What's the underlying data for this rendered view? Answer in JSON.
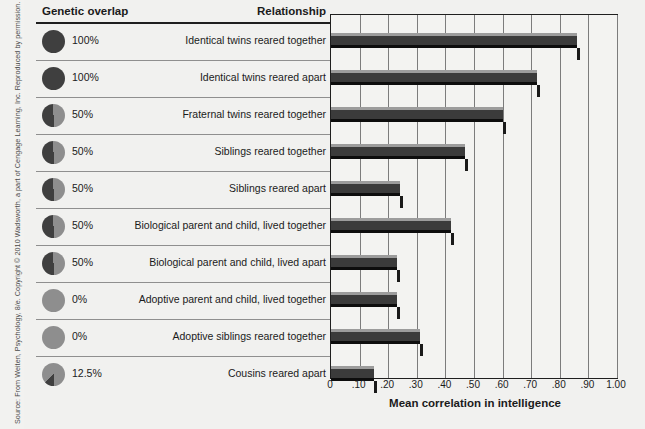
{
  "source_credit": "Source: From Weiten, Psychology, 8/e. Copyright © 2010 Wadsworth, a part of Cengage Learning, Inc. Reproduced by permission. www.cengage.com/permissions",
  "headers": {
    "genetic_overlap": "Genetic overlap",
    "relationship": "Relationship"
  },
  "rows": [
    {
      "percent": "100%",
      "overlap": 100,
      "relationship": "Identical twins reared together",
      "correlation": 0.86
    },
    {
      "percent": "100%",
      "overlap": 100,
      "relationship": "Identical twins reared apart",
      "correlation": 0.72
    },
    {
      "percent": "50%",
      "overlap": 50,
      "relationship": "Fraternal twins reared together",
      "correlation": 0.6
    },
    {
      "percent": "50%",
      "overlap": 50,
      "relationship": "Siblings reared together",
      "correlation": 0.47
    },
    {
      "percent": "50%",
      "overlap": 50,
      "relationship": "Siblings reared apart",
      "correlation": 0.24
    },
    {
      "percent": "50%",
      "overlap": 50,
      "relationship": "Biological parent and child, lived together",
      "correlation": 0.42
    },
    {
      "percent": "50%",
      "overlap": 50,
      "relationship": "Biological parent and child, lived apart",
      "correlation": 0.23
    },
    {
      "percent": "0%",
      "overlap": 0,
      "relationship": "Adoptive parent and child, lived together",
      "correlation": 0.23
    },
    {
      "percent": "0%",
      "overlap": 0,
      "relationship": "Adoptive siblings reared together",
      "correlation": 0.31
    },
    {
      "percent": "12.5%",
      "overlap": 12.5,
      "relationship": "Cousins reared apart",
      "correlation": 0.15
    }
  ],
  "axis": {
    "title": "Mean correlation in intelligence",
    "ticks": [
      "0",
      ".10",
      ".20",
      ".30",
      ".40",
      ".50",
      ".60",
      ".70",
      ".80",
      ".90",
      "1.00"
    ],
    "min": 0,
    "max": 1.0
  },
  "colors": {
    "bar_face": "#3b3b3b",
    "bar_highlight": "#9c9c9c",
    "bar_shadow": "#0d0d0d",
    "pie_dark": "#3f3f3f",
    "pie_light": "#8e8e8e",
    "background": "#f1f1ef",
    "rule": "#1f1f1f"
  },
  "chart_data": {
    "type": "bar",
    "orientation": "horizontal",
    "title": "",
    "xlabel": "Mean correlation in intelligence",
    "ylabel": "",
    "xlim": [
      0,
      1.0
    ],
    "xticks": [
      0,
      0.1,
      0.2,
      0.3,
      0.4,
      0.5,
      0.6,
      0.7,
      0.8,
      0.9,
      1.0
    ],
    "xticklabels": [
      "0",
      ".10",
      ".20",
      ".30",
      ".40",
      ".50",
      ".60",
      ".70",
      ".80",
      ".90",
      "1.00"
    ],
    "grid": true,
    "legend": "none",
    "categories": [
      "Identical twins reared together",
      "Identical twins reared apart",
      "Fraternal twins reared together",
      "Siblings reared together",
      "Siblings reared apart",
      "Biological parent and child, lived together",
      "Biological parent and child, lived apart",
      "Adoptive parent and child, lived together",
      "Adoptive siblings reared together",
      "Cousins reared apart"
    ],
    "values": [
      0.86,
      0.72,
      0.6,
      0.47,
      0.24,
      0.42,
      0.23,
      0.23,
      0.31,
      0.15
    ],
    "genetic_overlap_percent": [
      100,
      100,
      50,
      50,
      50,
      50,
      50,
      0,
      0,
      12.5
    ]
  }
}
